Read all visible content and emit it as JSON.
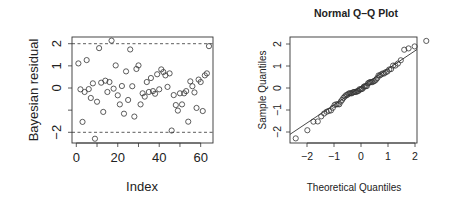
{
  "chart_data": [
    {
      "type": "scatter",
      "title": "",
      "xlabel": "Index",
      "ylabel": "Bayesian residual",
      "xlim": [
        -1,
        66
      ],
      "ylim": [
        -2.4,
        2.3
      ],
      "xticks": [
        0,
        20,
        40,
        60
      ],
      "yticks": [
        -2,
        0,
        2
      ],
      "ytick_labels_extra": [
        1,
        -1
      ],
      "grid": false,
      "reference_lines": [
        {
          "y": 2,
          "style": "dashed"
        },
        {
          "y": -2,
          "style": "dashed"
        }
      ],
      "x": [
        1,
        2,
        3,
        4,
        5,
        6,
        7,
        8,
        9,
        10,
        11,
        12,
        13,
        14,
        15,
        16,
        17,
        18,
        19,
        20,
        21,
        22,
        23,
        24,
        25,
        26,
        27,
        28,
        29,
        30,
        31,
        32,
        33,
        34,
        35,
        36,
        37,
        38,
        39,
        40,
        41,
        42,
        43,
        44,
        45,
        46,
        47,
        48,
        49,
        50,
        51,
        52,
        53,
        54,
        55,
        56,
        57,
        58,
        59,
        60,
        61,
        62,
        63,
        64
      ],
      "y": [
        1.11,
        -0.06,
        -1.53,
        -0.18,
        1.26,
        -0.05,
        -0.45,
        0.21,
        -2.29,
        -0.62,
        1.8,
        0.24,
        -1.08,
        0.33,
        -0.18,
        0.27,
        2.14,
        -0.03,
        1.02,
        -0.33,
        -0.74,
        0.09,
        -1.16,
        0.75,
        -0.54,
        1.74,
        0.08,
        -1.29,
        0.86,
        1.02,
        -0.74,
        -0.24,
        -0.39,
        0.27,
        -0.18,
        0.45,
        -0.14,
        -0.26,
        0.62,
        -0.06,
        0.84,
        0.72,
        0.57,
        0.05,
        0.66,
        -1.92,
        -0.32,
        -0.77,
        -1.02,
        -0.24,
        -0.74,
        -0.24,
        -0.14,
        -1.52,
        0.3,
        0.08,
        -0.2,
        -0.9,
        0.38,
        0.27,
        -1.04,
        0.57,
        0.66,
        1.89
      ]
    },
    {
      "type": "scatter",
      "title": "Normal Q–Q Plot",
      "xlabel": "Theoretical Quantiles",
      "ylabel": "Sample Quantiles",
      "xlim": [
        -2.63,
        2.08
      ],
      "ylim": [
        -2.4,
        2.3
      ],
      "xticks": [
        -2,
        -1,
        0,
        1,
        2
      ],
      "yticks": [
        -2,
        -1,
        0,
        1,
        2
      ],
      "grid": false,
      "reference_line": {
        "slope": 0.82,
        "intercept": 0.05
      },
      "sample_source": "sorted residuals from panel 1 vs. normal quantiles"
    }
  ],
  "left": {
    "xlabel": "Index",
    "ylabel": "Bayesian residual",
    "xticks": [
      "0",
      "20",
      "40",
      "60"
    ],
    "yticks": [
      "−2",
      "0",
      "2"
    ]
  },
  "right": {
    "title": "Normal Q–Q Plot",
    "xlabel": "Theoretical Quantiles",
    "ylabel": "Sample Quantiles",
    "xticks": [
      "−2",
      "−1",
      "0",
      "1",
      "2"
    ],
    "yticks": [
      "−2",
      "−1",
      "0",
      "1",
      "2"
    ]
  },
  "colors": {
    "axis": "#333333",
    "point": "#333333",
    "background": "#ffffff"
  }
}
